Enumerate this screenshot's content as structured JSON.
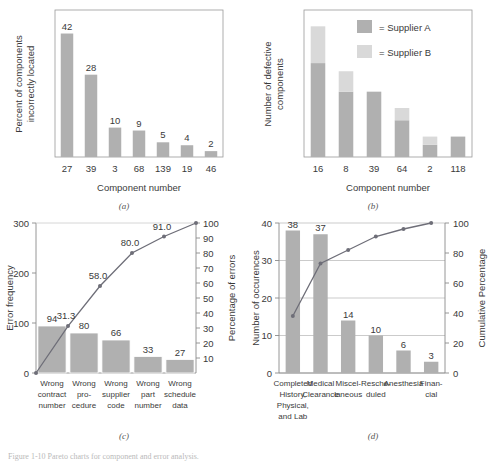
{
  "figure": {
    "caption": "Figure 1-10  Pareto charts for component and error analysis.",
    "bar_color_dark": "#b0b0b0",
    "bar_color_light": "#d9d9d9",
    "line_color": "#6e6e78",
    "axis_color": "#8a8a8a"
  },
  "panels": {
    "a": {
      "label": "(a)",
      "ylabel_line1": "Percent of components",
      "ylabel_line2": "incorrectly located",
      "xlabel": "Component number"
    },
    "b": {
      "label": "(b)",
      "ylabel_line1": "Number of defective",
      "ylabel_line2": "components",
      "xlabel": "Component number",
      "legend": [
        {
          "swatch": "dark",
          "text": "=  Supplier A"
        },
        {
          "swatch": "light",
          "text": "=  Supplier B"
        }
      ]
    },
    "c": {
      "label": "(c)",
      "ylabel_left": "Error frequency",
      "ylabel_right": "Percentage of errors"
    },
    "d": {
      "label": "(d)",
      "ylabel_left": "Number of occurences",
      "ylabel_right": "Cumulative Percentage"
    }
  },
  "chart_data": [
    {
      "id": "a",
      "type": "bar",
      "title": "",
      "xlabel": "Component number",
      "ylabel": "Percent of components incorrectly located",
      "categories": [
        "27",
        "39",
        "3",
        "68",
        "139",
        "19",
        "46"
      ],
      "values": [
        42,
        28,
        10,
        9,
        5,
        4,
        2
      ],
      "value_labels": [
        "42",
        "28",
        "10",
        "9",
        "5",
        "4",
        "2"
      ],
      "ylim": [
        0,
        50
      ],
      "yticks": [],
      "grid": false,
      "legend": "none"
    },
    {
      "id": "b",
      "type": "bar",
      "stacked": true,
      "title": "",
      "xlabel": "Component number",
      "ylabel": "Number of defective components",
      "categories": [
        "16",
        "8",
        "39",
        "64",
        "2",
        "118"
      ],
      "series": [
        {
          "name": "Supplier A",
          "values": [
            23,
            16,
            16,
            9,
            3,
            5
          ]
        },
        {
          "name": "Supplier B",
          "values": [
            9,
            5,
            0,
            3,
            2,
            0
          ]
        }
      ],
      "ylim": [
        0,
        36
      ],
      "yticks": [],
      "grid": false,
      "legend": "inside-top-right"
    },
    {
      "id": "c",
      "type": "bar",
      "pareto": true,
      "title": "",
      "xlabel": "",
      "ylabel": "Error frequency",
      "ylabel_right": "Percentage of errors",
      "categories": [
        "Wrong contract number",
        "Wrong pro- cedure",
        "Wrong supplier code",
        "Wrong part number",
        "Wrong schedule data"
      ],
      "category_lines": [
        [
          "Wrong",
          "contract",
          "number"
        ],
        [
          "Wrong",
          "pro-",
          "cedure"
        ],
        [
          "Wrong",
          "supplier",
          "code"
        ],
        [
          "Wrong",
          "part",
          "number"
        ],
        [
          "Wrong",
          "schedule",
          "data"
        ]
      ],
      "values": [
        94,
        80,
        66,
        33,
        27
      ],
      "value_labels": [
        "94",
        "80",
        "66",
        "33",
        "27"
      ],
      "cumulative": [
        31.3,
        58.0,
        80.0,
        91.0,
        100.0
      ],
      "cumulative_labels": [
        "31.3",
        "58.0",
        "80.0",
        "91.0",
        ""
      ],
      "ylim": [
        0,
        300
      ],
      "yticks": [
        0,
        100,
        200,
        300
      ],
      "ylim_right": [
        0,
        100
      ],
      "yticks_right": [
        10,
        20,
        30,
        40,
        50,
        60,
        70,
        80,
        90,
        100
      ],
      "grid": false,
      "legend": "none"
    },
    {
      "id": "d",
      "type": "bar",
      "pareto": true,
      "title": "",
      "xlabel": "",
      "ylabel": "Number of occurences",
      "ylabel_right": "Cumulative Percentage",
      "categories": [
        "Completed History, Physical, and Lab",
        "Medical Clearance",
        "Miscel- laneous",
        "Resche- duled",
        "Anesthesia",
        "Finan- cial"
      ],
      "category_lines": [
        [
          "Completed",
          "History,",
          "Physical,",
          "and Lab"
        ],
        [
          "Medical",
          "Clearance"
        ],
        [
          "Miscel-",
          "laneous"
        ],
        [
          "Resche-",
          "duled"
        ],
        [
          "Anesthesia"
        ],
        [
          "Finan-",
          "cial"
        ]
      ],
      "values": [
        38,
        37,
        14,
        10,
        6,
        3
      ],
      "value_labels": [
        "38",
        "37",
        "14",
        "10",
        "6",
        "3"
      ],
      "cumulative": [
        38,
        73,
        82,
        91,
        96,
        100
      ],
      "ylim": [
        0,
        40
      ],
      "yticks": [
        0,
        10,
        20,
        30,
        40
      ],
      "ylim_right": [
        0,
        100
      ],
      "yticks_right": [
        0,
        20,
        40,
        60,
        80,
        100
      ],
      "grid": true,
      "legend": "none"
    }
  ]
}
